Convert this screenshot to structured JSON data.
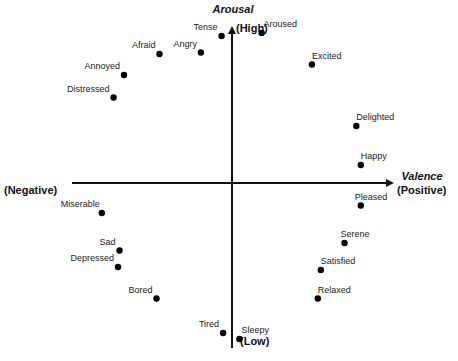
{
  "diagram": {
    "vertical_axis": {
      "title": "Arousal",
      "top_label": "(High)",
      "bottom_label": "(Low)"
    },
    "horizontal_axis": {
      "title": "Valence",
      "right_label": "(Positive)",
      "left_label": "(Negative)"
    },
    "axis_range": {
      "valence": [
        -1,
        1
      ],
      "arousal": [
        -1,
        1
      ]
    },
    "emotions": [
      {
        "name": "Tense",
        "valence": -0.07,
        "arousal": 0.98
      },
      {
        "name": "Aroused",
        "valence": 0.2,
        "arousal": 1.0
      },
      {
        "name": "Angry",
        "valence": -0.21,
        "arousal": 0.87
      },
      {
        "name": "Afraid",
        "valence": -0.49,
        "arousal": 0.86
      },
      {
        "name": "Annoyed",
        "valence": -0.73,
        "arousal": 0.72
      },
      {
        "name": "Distressed",
        "valence": -0.8,
        "arousal": 0.57
      },
      {
        "name": "Excited",
        "valence": 0.54,
        "arousal": 0.79
      },
      {
        "name": "Delighted",
        "valence": 0.84,
        "arousal": 0.38
      },
      {
        "name": "Happy",
        "valence": 0.87,
        "arousal": 0.12
      },
      {
        "name": "Pleased",
        "valence": 0.87,
        "arousal": -0.15
      },
      {
        "name": "Serene",
        "valence": 0.76,
        "arousal": -0.4
      },
      {
        "name": "Satisfied",
        "valence": 0.6,
        "arousal": -0.58
      },
      {
        "name": "Relaxed",
        "valence": 0.58,
        "arousal": -0.77
      },
      {
        "name": "Miserable",
        "valence": -0.88,
        "arousal": -0.2
      },
      {
        "name": "Sad",
        "valence": -0.76,
        "arousal": -0.45
      },
      {
        "name": "Depressed",
        "valence": -0.77,
        "arousal": -0.56
      },
      {
        "name": "Bored",
        "valence": -0.51,
        "arousal": -0.77
      },
      {
        "name": "Tired",
        "valence": -0.06,
        "arousal": -1.0
      },
      {
        "name": "Sleepy",
        "valence": 0.05,
        "arousal": -1.04
      }
    ]
  }
}
